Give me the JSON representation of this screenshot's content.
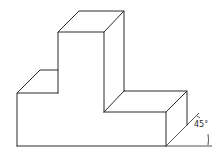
{
  "figure": {
    "type": "oblique-projection",
    "angle_label": "45°",
    "line_color": "#2a2a2a",
    "background": "#ffffff"
  }
}
